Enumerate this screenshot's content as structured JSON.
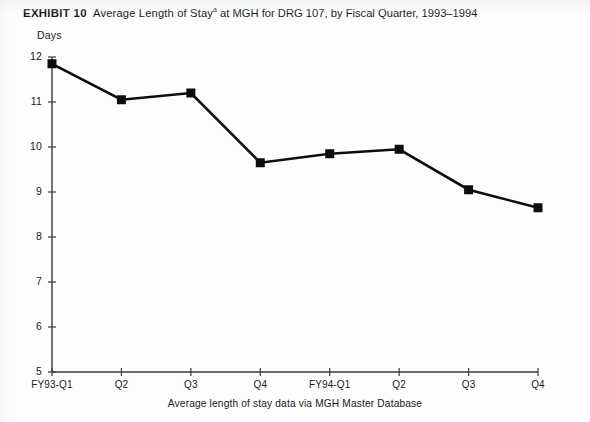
{
  "title": {
    "exhibit_label": "EXHIBIT 10",
    "text": "Average Length of Stay",
    "footnote_mark": "a",
    "text_tail": " at MGH for DRG 107, by Fiscal Quarter, 1993–1994"
  },
  "caption": "Average length of stay data via MGH Master Database",
  "colors": {
    "ink": "#111111",
    "paper": "#fdfdfd",
    "axis": "#3a3a3a",
    "marker": "#0d0d0d"
  },
  "chart_data": {
    "type": "line",
    "xlabel": "",
    "ylabel": "Days",
    "categories": [
      "FY93-Q1",
      "Q2",
      "Q3",
      "Q4",
      "FY94-Q1",
      "Q2",
      "Q3",
      "Q4"
    ],
    "values": [
      11.85,
      11.05,
      11.2,
      9.65,
      9.85,
      9.95,
      9.05,
      8.65
    ],
    "ylim": [
      5,
      12
    ],
    "yticks": [
      5,
      6,
      7,
      8,
      9,
      10,
      11,
      12
    ],
    "ytick_labels": [
      "5",
      "6",
      "7",
      "8",
      "9",
      "10",
      "11",
      "12"
    ],
    "grid": false,
    "legend": "none",
    "marker": "square",
    "annotation": "Average length of stay data via MGH Master Database"
  }
}
